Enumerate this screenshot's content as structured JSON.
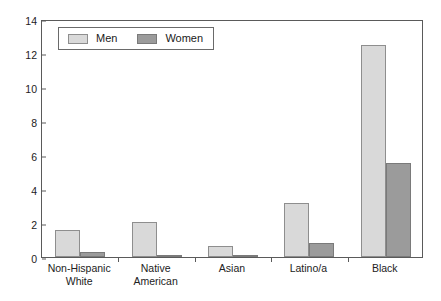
{
  "chart_data": {
    "type": "bar",
    "title": "",
    "subtitle": "",
    "xlabel": "",
    "ylabel": "",
    "ylim": [
      0,
      14
    ],
    "yticks": [
      0,
      2,
      4,
      6,
      8,
      10,
      12,
      14
    ],
    "ytick_labels": [
      "0",
      "2",
      "4",
      "6",
      "8",
      "10",
      "12",
      "14"
    ],
    "grid": false,
    "legend_position": "top-left",
    "categories": [
      "Non-Hispanic White",
      "Native American",
      "Asian",
      "Latino/a",
      "Black"
    ],
    "category_lines": [
      [
        "Non-Hispanic",
        "White"
      ],
      [
        "Native",
        "American"
      ],
      [
        "Asian"
      ],
      [
        "Latino/a"
      ],
      [
        "Black"
      ]
    ],
    "series": [
      {
        "name": "Men",
        "color": "#d9d9d9",
        "values": [
          1.6,
          2.05,
          0.65,
          3.2,
          12.5
        ]
      },
      {
        "name": "Women",
        "color": "#9b9b9b",
        "values": [
          0.3,
          0.12,
          0.1,
          0.8,
          5.55
        ]
      }
    ]
  }
}
